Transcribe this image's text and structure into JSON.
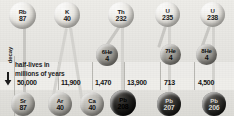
{
  "diagram": {
    "axis": {
      "decay_label": "decay",
      "arrow_icon": "down-arrow-icon"
    },
    "legend": {
      "line1": "half-lives in",
      "line2": "millions of years"
    },
    "parents": [
      {
        "symbol": "Rb",
        "mass": "87",
        "half_life": "50,000"
      },
      {
        "symbol": "K",
        "mass": "40",
        "half_life": "11,900"
      },
      {
        "symbol": "Th",
        "mass": "232",
        "half_life": "13,900"
      },
      {
        "symbol": "U",
        "mass": "235",
        "half_life": "713"
      },
      {
        "symbol": "U",
        "mass": "238",
        "half_life": "4,500"
      }
    ],
    "byproducts": [
      {
        "label": "6He",
        "mass": "4"
      },
      {
        "label": "7He",
        "mass": "4"
      },
      {
        "label": "8He",
        "mass": "4"
      }
    ],
    "daughters": [
      {
        "symbol": "Sr",
        "mass": "87"
      },
      {
        "symbol": "Ar",
        "mass": "40"
      },
      {
        "symbol": "Ca",
        "mass": "40"
      },
      {
        "symbol": "Pb",
        "mass": "208"
      },
      {
        "symbol": "Pb",
        "mass": "207"
      },
      {
        "symbol": "Pb",
        "mass": "206"
      }
    ],
    "half_life_values": [
      "50,000",
      "11,900",
      "1,470",
      "13,900",
      "713",
      "4,500"
    ],
    "colors": {
      "background": "#e8e7e3",
      "sphere_light": "#eceae5",
      "sphere_dark": "#1a1a18",
      "rule": "#b9b8b3",
      "text": "#141414"
    }
  }
}
